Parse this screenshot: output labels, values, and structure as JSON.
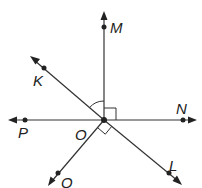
{
  "diagram": {
    "title": "",
    "vertex": {
      "label": "O",
      "x": 104,
      "y": 120
    },
    "rays": [
      {
        "id": "OM",
        "point": {
          "label": "M",
          "x": 104,
          "y": 27
        },
        "tip": {
          "x": 104,
          "y": 12
        },
        "label_pos": {
          "x": 110,
          "y": 35
        }
      },
      {
        "id": "ON",
        "point": {
          "label": "N",
          "x": 183,
          "y": 120
        },
        "tip": {
          "x": 196,
          "y": 120
        },
        "label_pos": {
          "x": 177,
          "y": 112
        }
      },
      {
        "id": "OP",
        "point": {
          "label": "P",
          "x": 25,
          "y": 120
        },
        "tip": {
          "x": 9,
          "y": 120
        },
        "label_pos": {
          "x": 18,
          "y": 138
        }
      },
      {
        "id": "OK",
        "point": {
          "label": "K",
          "x": 44,
          "y": 68
        },
        "tip": {
          "x": 31,
          "y": 57
        },
        "label_pos": {
          "x": 34,
          "y": 85
        }
      },
      {
        "id": "OL",
        "point": {
          "label": "L",
          "x": 169,
          "y": 173
        },
        "tip": {
          "x": 181,
          "y": 184
        },
        "label_pos": {
          "x": 168,
          "y": 170
        }
      },
      {
        "id": "OQ",
        "point": {
          "label": "Q",
          "x": 58,
          "y": 173
        },
        "tip": {
          "x": 49,
          "y": 185
        },
        "label_pos": {
          "x": 61,
          "y": 188
        }
      }
    ],
    "vertex_label_pos": {
      "x": 75,
      "y": 140
    },
    "angle_marks": [
      {
        "type": "arc",
        "between": [
          "OK",
          "OM"
        ]
      },
      {
        "type": "right-angle",
        "between": [
          "OM",
          "ON"
        ]
      },
      {
        "type": "right-angle",
        "between": [
          "OL",
          "OQ"
        ]
      }
    ],
    "colors": {
      "line": "#333333",
      "point": "#222222",
      "background": "#ffffff"
    }
  }
}
